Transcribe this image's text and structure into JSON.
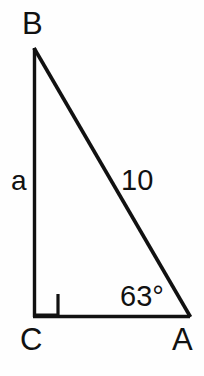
{
  "figure": {
    "type": "right-triangle-diagram",
    "background_color": "#fefefe",
    "stroke_color": "#111111",
    "vertices": {
      "B": {
        "label": "B",
        "x": 34,
        "y": 48
      },
      "C": {
        "label": "C",
        "x": 34,
        "y": 317
      },
      "A": {
        "label": "A",
        "x": 190,
        "y": 317
      }
    },
    "labels": {
      "vertex_b": "B",
      "vertex_c": "C",
      "vertex_a": "A",
      "side_a": "a",
      "side_hypotenuse": "10",
      "angle_a": "63°"
    },
    "right_angle": {
      "at_vertex": "C",
      "marker": "square",
      "size_px": 23
    },
    "measurements": {
      "hypotenuse_length": "10",
      "unknown_side": "a",
      "angle_at_A_degrees": "63"
    }
  }
}
